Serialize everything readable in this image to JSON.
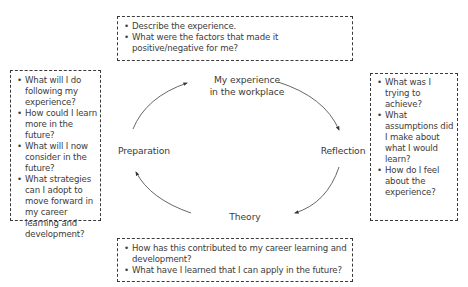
{
  "diagram": {
    "type": "cycle",
    "stages": [
      {
        "id": "experience",
        "label_line1": "My experience",
        "label_line2": "in the workplace"
      },
      {
        "id": "reflection",
        "label": "Reflection"
      },
      {
        "id": "theory",
        "label": "Theory"
      },
      {
        "id": "preparation",
        "label": "Preparation"
      }
    ],
    "flow": [
      "experience",
      "reflection",
      "theory",
      "preparation",
      "experience"
    ],
    "line_color": "#3a3a3a"
  },
  "boxes": {
    "top": {
      "attached_to": "experience",
      "questions": [
        "Describe the experience.",
        "What were the factors that made it positive/negative for me?"
      ]
    },
    "right": {
      "attached_to": "reflection",
      "questions": [
        "What was I trying to achieve?",
        "What assumptions did I make about what I would learn?",
        "How do I feel about the experience?"
      ]
    },
    "bottom": {
      "attached_to": "theory",
      "questions": [
        "How has this contributed to my career learning and development?",
        "What have I learned that I can apply in the future?"
      ]
    },
    "left": {
      "attached_to": "preparation",
      "questions": [
        "What will I do following my experience?",
        "How could I learn more in the future?",
        "What will I now consider in the future?",
        "What strategies can I adopt to move forward in my career learning and development?"
      ]
    }
  }
}
